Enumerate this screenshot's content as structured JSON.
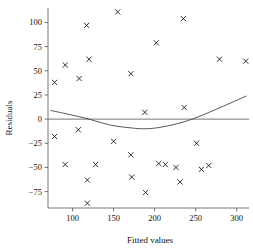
{
  "chart_data": {
    "type": "scatter",
    "title": "",
    "xlabel": "Fitted values",
    "ylabel": "Residuals",
    "xlim": [
      70,
      315
    ],
    "ylim": [
      -92,
      115
    ],
    "xticks": [
      100,
      150,
      200,
      250,
      300
    ],
    "xtick_labels": [
      "100",
      "150",
      "200",
      "250",
      "300"
    ],
    "yticks": [
      100,
      75,
      50,
      25,
      0,
      -25,
      -50,
      -75
    ],
    "ytick_labels": [
      "100",
      "75",
      "50",
      "25",
      "0",
      "−25",
      "−50",
      "−75"
    ],
    "grid": false,
    "legend": null,
    "marker": "x",
    "points": [
      {
        "x": 78,
        "y": 38
      },
      {
        "x": 91,
        "y": 56
      },
      {
        "x": 108,
        "y": 42
      },
      {
        "x": 117,
        "y": 97
      },
      {
        "x": 120,
        "y": 62
      },
      {
        "x": 155,
        "y": 111
      },
      {
        "x": 171,
        "y": 47
      },
      {
        "x": 202,
        "y": 79
      },
      {
        "x": 235,
        "y": 104
      },
      {
        "x": 236,
        "y": 12
      },
      {
        "x": 279,
        "y": 62
      },
      {
        "x": 311,
        "y": 60
      },
      {
        "x": 188,
        "y": 7
      },
      {
        "x": 78,
        "y": -18
      },
      {
        "x": 107,
        "y": -11
      },
      {
        "x": 150,
        "y": -23
      },
      {
        "x": 251,
        "y": -25
      },
      {
        "x": 171,
        "y": -37
      },
      {
        "x": 91,
        "y": -47
      },
      {
        "x": 128,
        "y": -47
      },
      {
        "x": 205,
        "y": -46
      },
      {
        "x": 213,
        "y": -47
      },
      {
        "x": 266,
        "y": -48
      },
      {
        "x": 226,
        "y": -50
      },
      {
        "x": 257,
        "y": -52
      },
      {
        "x": 172,
        "y": -60
      },
      {
        "x": 118,
        "y": -63
      },
      {
        "x": 231,
        "y": -65
      },
      {
        "x": 189,
        "y": -76
      },
      {
        "x": 118,
        "y": -87
      }
    ],
    "reference_line": {
      "kind": "horizontal",
      "y": 0
    },
    "smooth_curve": {
      "kind": "lowess",
      "points": [
        {
          "x": 73,
          "y": 9
        },
        {
          "x": 95,
          "y": 5
        },
        {
          "x": 120,
          "y": 0
        },
        {
          "x": 145,
          "y": -6
        },
        {
          "x": 170,
          "y": -9
        },
        {
          "x": 190,
          "y": -10
        },
        {
          "x": 210,
          "y": -8
        },
        {
          "x": 235,
          "y": -3
        },
        {
          "x": 255,
          "y": 3
        },
        {
          "x": 280,
          "y": 12
        },
        {
          "x": 312,
          "y": 24
        }
      ]
    }
  }
}
